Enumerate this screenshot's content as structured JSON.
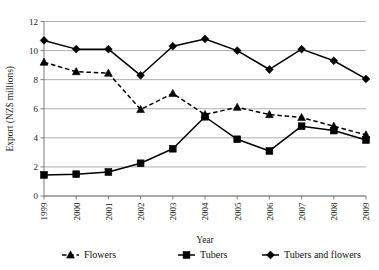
{
  "chart_data": {
    "type": "line",
    "title": "",
    "xlabel": "Year",
    "ylabel": "Export (NZ$ millions)",
    "categories": [
      "1999",
      "2000",
      "2001",
      "2002",
      "2003",
      "2004",
      "2005",
      "2006",
      "2007",
      "2008",
      "2009"
    ],
    "ylim": [
      0,
      12
    ],
    "yticks": [
      "0",
      "2",
      "4",
      "6",
      "8",
      "10",
      "12"
    ],
    "grid": true,
    "legend_position": "bottom",
    "series": [
      {
        "name": "Flowers",
        "marker": "triangle",
        "linestyle": "dashed",
        "color": "#000000",
        "values": [
          9.2,
          8.55,
          8.45,
          5.95,
          7.05,
          5.6,
          6.1,
          5.6,
          5.4,
          4.8,
          4.2
        ]
      },
      {
        "name": "Tubers",
        "marker": "square",
        "linestyle": "solid",
        "color": "#000000",
        "values": [
          1.45,
          1.5,
          1.65,
          2.25,
          3.25,
          5.45,
          3.9,
          3.1,
          4.8,
          4.5,
          3.85
        ]
      },
      {
        "name": "Tubers and flowers",
        "marker": "diamond",
        "linestyle": "solid",
        "color": "#000000",
        "values": [
          10.7,
          10.1,
          10.1,
          8.3,
          10.3,
          10.8,
          10.0,
          8.7,
          10.1,
          9.3,
          8.05
        ]
      }
    ]
  },
  "legend": {
    "items": [
      {
        "label": "Flowers"
      },
      {
        "label": "Tubers"
      },
      {
        "label": "Tubers and flowers"
      }
    ]
  }
}
